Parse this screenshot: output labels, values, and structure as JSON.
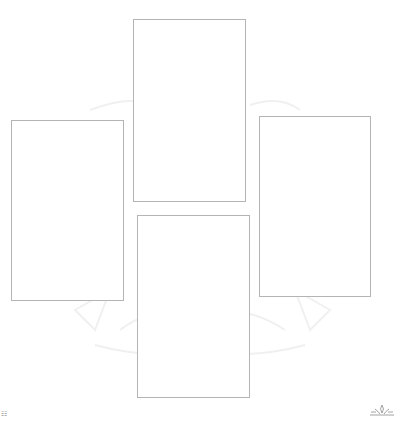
{
  "layout": {
    "arrangement": "cross",
    "background_color": "#ffffff",
    "card_border_color": "#b4b4b4",
    "watermark_color": "#f2f2f2"
  },
  "cards": [
    {
      "id": "top",
      "label": "",
      "x": 133,
      "y": 19,
      "w": 113,
      "h": 183
    },
    {
      "id": "left",
      "label": "",
      "x": 11,
      "y": 120,
      "w": 113,
      "h": 181
    },
    {
      "id": "right",
      "label": "",
      "x": 259,
      "y": 116,
      "w": 112,
      "h": 181
    },
    {
      "id": "bottom",
      "label": "",
      "x": 137,
      "y": 215,
      "w": 113,
      "h": 183
    }
  ],
  "footer": {
    "left_mark": "☷",
    "logo_icon": "lotus-logo-icon"
  }
}
